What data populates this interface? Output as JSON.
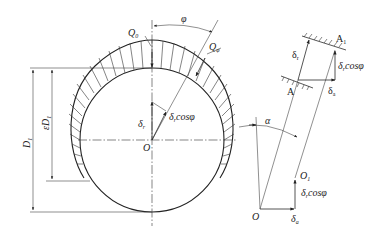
{
  "figure": {
    "left_view": {
      "center_label": "O",
      "labels": {
        "Q0": {
          "main": "Q",
          "sub": "0"
        },
        "Qphi": {
          "main": "Q",
          "sub": "φ"
        },
        "phi": "φ",
        "delta_r": {
          "main": "δ",
          "sub": "r"
        },
        "delta_r_cos": {
          "main": "δ",
          "sub": "r",
          "tail": "cosφ"
        },
        "D1": {
          "main": "D",
          "sub": "1"
        },
        "epsD1": {
          "main": "εD",
          "sub": "1"
        }
      }
    },
    "right_view": {
      "labels": {
        "A": "A",
        "A1": {
          "main": "A",
          "sub": "1"
        },
        "delta_r": {
          "main": "δ",
          "sub": "r"
        },
        "delta_r_cos_top": {
          "main": "δ",
          "sub": "r",
          "tail": "cosφ"
        },
        "delta_a_top": {
          "main": "δ",
          "sub": "a"
        },
        "alpha": "α",
        "O": "O",
        "O1": {
          "main": "O",
          "sub": "1"
        },
        "delta_r_cos_bottom": {
          "main": "δ",
          "sub": "r",
          "tail": "cosφ"
        },
        "delta_a_bottom": {
          "main": "δ",
          "sub": "a"
        }
      }
    },
    "colors": {
      "line": "#2a2a2a",
      "background": "#ffffff"
    }
  }
}
